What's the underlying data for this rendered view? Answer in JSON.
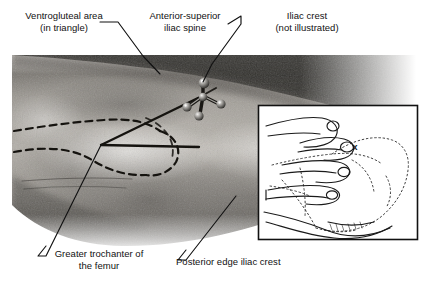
{
  "figure": {
    "kind": "anatomical-photograph-with-inset-diagram",
    "background_color": "#ffffff",
    "line_color": "#111111",
    "photo": {
      "name": "hip-photograph",
      "description": "Grayscale photograph of a patient's lateral hip and buttock with landmark lines drawn on the skin",
      "tone_light": "#d8d6d2",
      "tone_mid": "#9a9791",
      "tone_dark": "#4a4845"
    },
    "marker": {
      "name": "injection-site-marker",
      "description": "Cross-shaped metal marker placed on the skin over the injection site"
    },
    "inset": {
      "name": "hand-placement-inset",
      "description": "Line drawing showing the nurse's hand positioned on the greater trochanter with fingers spread toward the iliac crest",
      "mark": "x",
      "border_color": "#111111"
    }
  },
  "labels": {
    "ventrogluteal": "Ventrogluteal area\n(in triangle)",
    "anterior_superior_iliac_spine": "Anterior-superior\niliac spine",
    "iliac_crest": "Iliac crest\n(not illustrated)",
    "greater_trochanter": "Greater trochanter of\nthe femur",
    "posterior_edge_iliac_crest": "Posterior edge iliac crest"
  }
}
